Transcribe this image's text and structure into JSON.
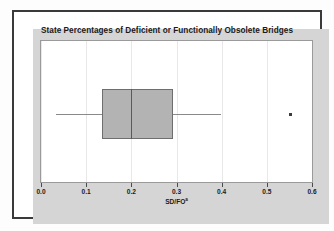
{
  "figure": {
    "title": "State Percentages of Deficient or Functionally Obsolete Bridges",
    "axis_label_main": "SD/FO",
    "axis_label_marker": "a"
  },
  "colors": {
    "panel_background": "#d5d5d5",
    "plot_background": "#ffffff",
    "frame_border": "#3a3a3a",
    "box_fill": "#b3b3b3",
    "box_edge": "#6e6e6e",
    "median": "#5a5a5a",
    "whisker": "#8a8a8a",
    "outlier": "#3c3c3c",
    "gridline": "#e8e8e8",
    "text": "#1a1a1a"
  },
  "chart_data": {
    "type": "box",
    "title": "State Percentages of Deficient or Functionally Obsolete Bridges",
    "xlabel": "SD/FO",
    "ylabel": "",
    "xlim": [
      0.0,
      0.6
    ],
    "xticks": [
      0.0,
      0.1,
      0.2,
      0.3,
      0.4,
      0.5,
      0.6
    ],
    "xticklabels": [
      "0.0",
      "0.1",
      "0.2",
      "0.3",
      "0.4",
      "0.5",
      "0.6"
    ],
    "grid": true,
    "grid_axis": "x",
    "orientation": "horizontal",
    "legend": null,
    "series": [
      {
        "name": "SD/FO",
        "min_whisker": 0.033,
        "q1": 0.135,
        "median": 0.2,
        "q3": 0.293,
        "max_whisker": 0.398,
        "outliers": [
          0.552
        ]
      }
    ]
  }
}
